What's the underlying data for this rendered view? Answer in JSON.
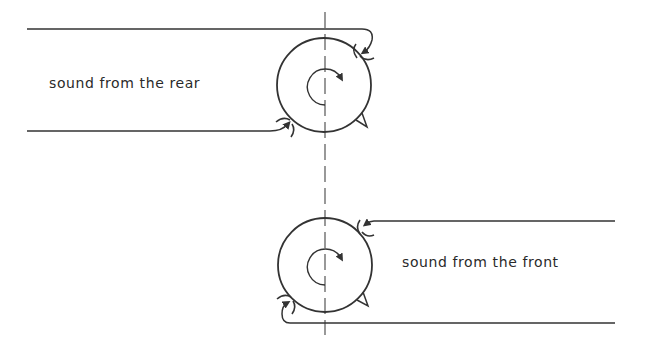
{
  "labels": {
    "rear": "sound from the rear",
    "front": "sound from the front"
  },
  "colors": {
    "stroke": "#333333",
    "axis": "#555555",
    "text": "#2a2a2a"
  },
  "diagrams": [
    {
      "name": "rear-incidence",
      "description": "Cardioid microphone capsule with sound arriving from the rear, entering both front and rear ports",
      "circle": {
        "cx": 324,
        "cy": 85,
        "r": 47
      }
    },
    {
      "name": "front-incidence",
      "description": "Cardioid microphone capsule with sound arriving from the front",
      "circle": {
        "cx": 325,
        "cy": 265,
        "r": 47
      }
    }
  ]
}
